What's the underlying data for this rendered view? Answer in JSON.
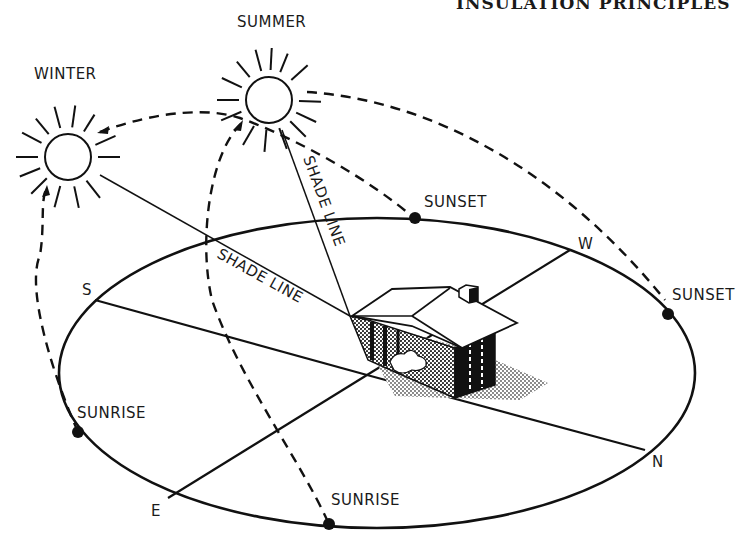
{
  "header": {
    "title": "INSULATION PRINCIPLES"
  },
  "suns": [
    {
      "id": "winter",
      "label": "WINTER"
    },
    {
      "id": "summer",
      "label": "SUMMER"
    }
  ],
  "shade_lines": [
    {
      "label": "SHADE LINE"
    },
    {
      "label": "SHADE LINE"
    }
  ],
  "compass": {
    "s": "S",
    "w": "W",
    "n": "N",
    "e": "E"
  },
  "events": {
    "summer_sunset": "SUNSET",
    "winter_sunset": "SUNSET",
    "winter_sunrise": "SUNRISE",
    "summer_sunrise": "SUNRISE"
  },
  "colors": {
    "ink": "#111111",
    "background": "#ffffff",
    "shade": "#888888"
  }
}
